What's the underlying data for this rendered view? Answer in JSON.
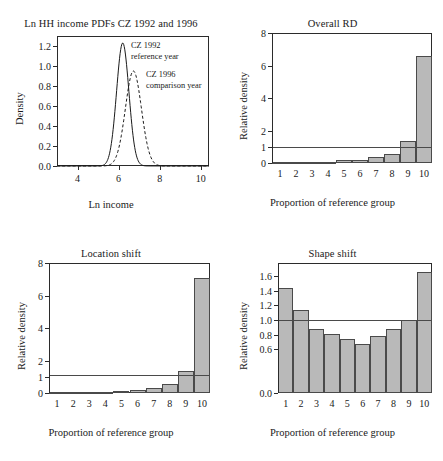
{
  "figure": {
    "panels": [
      "Ln HH income PDFs CZ 1992 and 1996",
      "Overall RD",
      "Location shift",
      "Shape shift"
    ]
  },
  "chart_data": [
    {
      "id": "ln-hh-income-pdfs",
      "type": "line",
      "title": "Ln HH income PDFs CZ 1992 and 1996",
      "xlabel": "Ln income",
      "ylabel": "Density",
      "xlim": [
        3.0,
        10.4
      ],
      "ylim": [
        0.0,
        1.3
      ],
      "xticks": [
        4,
        6,
        8,
        10
      ],
      "yticks": [
        0.0,
        0.2,
        0.4,
        0.6,
        0.8,
        1.0,
        1.2
      ],
      "grid": false,
      "legend": "inline-annotations",
      "annotations": [
        {
          "text_line1": "CZ 1992",
          "text_line2": "reference year"
        },
        {
          "text_line1": "CZ 1996",
          "text_line2": "comparison year"
        }
      ],
      "series": [
        {
          "name": "CZ 1992 reference year",
          "style": "solid",
          "peak_x": 6.2,
          "peak_y": 1.23,
          "sigma": 0.3
        },
        {
          "name": "CZ 1996 comparison year",
          "style": "dashed",
          "peak_x": 6.72,
          "peak_y": 0.95,
          "sigma": 0.39
        }
      ]
    },
    {
      "id": "overall-rd",
      "type": "bar",
      "title": "Overall RD",
      "xlabel": "Proportion of reference group",
      "ylabel": "Relative density",
      "categories": [
        "1",
        "2",
        "3",
        "4",
        "5",
        "6",
        "7",
        "8",
        "9",
        "10"
      ],
      "values": [
        0.03,
        0.03,
        0.03,
        0.03,
        0.17,
        0.21,
        0.35,
        0.58,
        1.35,
        6.6
      ],
      "ylim": [
        0,
        8
      ],
      "yticks": [
        0,
        1,
        2,
        4,
        6,
        8
      ],
      "reference_line": 1,
      "grid": false
    },
    {
      "id": "location-shift",
      "type": "bar",
      "title": "Location shift",
      "xlabel": "Proportion of reference group",
      "ylabel": "Relative density",
      "categories": [
        "1",
        "2",
        "3",
        "4",
        "5",
        "6",
        "7",
        "8",
        "9",
        "10"
      ],
      "values": [
        0.03,
        0.03,
        0.03,
        0.04,
        0.15,
        0.2,
        0.33,
        0.55,
        1.38,
        7.1
      ],
      "ylim": [
        0,
        8
      ],
      "yticks": [
        0,
        1,
        2,
        4,
        6,
        8
      ],
      "reference_line": 1.1,
      "grid": false
    },
    {
      "id": "shape-shift",
      "type": "bar",
      "title": "Shape shift",
      "xlabel": "Proportion of reference group",
      "ylabel": "Relative density",
      "categories": [
        "1",
        "2",
        "3",
        "4",
        "5",
        "6",
        "7",
        "8",
        "9",
        "10"
      ],
      "values": [
        1.44,
        1.14,
        0.87,
        0.81,
        0.74,
        0.67,
        0.78,
        0.87,
        1.0,
        1.65
      ],
      "ylim": [
        0.0,
        1.78
      ],
      "yticks": [
        0.0,
        0.6,
        0.8,
        1.0,
        1.2,
        1.4,
        1.6
      ],
      "reference_line": 1.0,
      "grid": false
    }
  ]
}
